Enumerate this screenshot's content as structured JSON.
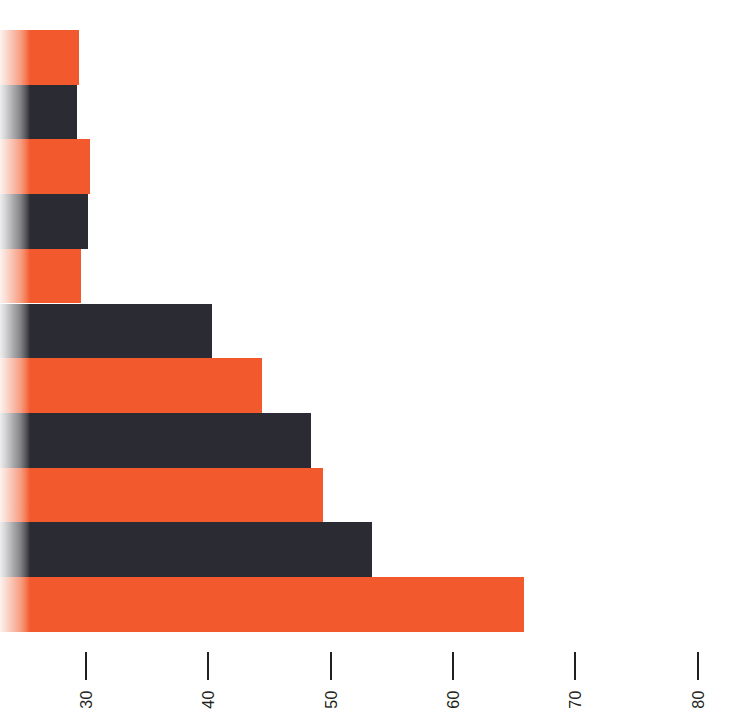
{
  "chart_data": {
    "type": "bar",
    "orientation": "horizontal",
    "title": "",
    "subtitle": "",
    "xlabel": "",
    "ylabel": "",
    "grid": false,
    "legend": null,
    "axis": {
      "tick_labels": [
        "30",
        "40",
        "50",
        "60",
        "70",
        "80"
      ],
      "tick_values": [
        30,
        40,
        50,
        60,
        70,
        80
      ],
      "tick_label_rotation": -90,
      "xlim": [
        28,
        84
      ],
      "axis_line": false
    },
    "categories": [
      "",
      "",
      "",
      "",
      "",
      "",
      "",
      "",
      "",
      "",
      ""
    ],
    "values": [
      29.4,
      29.3,
      30.3,
      30.2,
      29.6,
      40.3,
      44.4,
      48.4,
      49.4,
      53.4,
      65.8
    ],
    "bar_colors": [
      "#f2592c",
      "#2b2b33",
      "#f2592c",
      "#2b2b33",
      "#f2592c",
      "#2b2b33",
      "#f2592c",
      "#2b2b33",
      "#f2592c",
      "#2b2b33",
      "#f2592c"
    ],
    "colors": {
      "orange": "#f2592c",
      "dark": "#2b2b33",
      "background": "#ffffff",
      "tick": "#231f20"
    }
  }
}
